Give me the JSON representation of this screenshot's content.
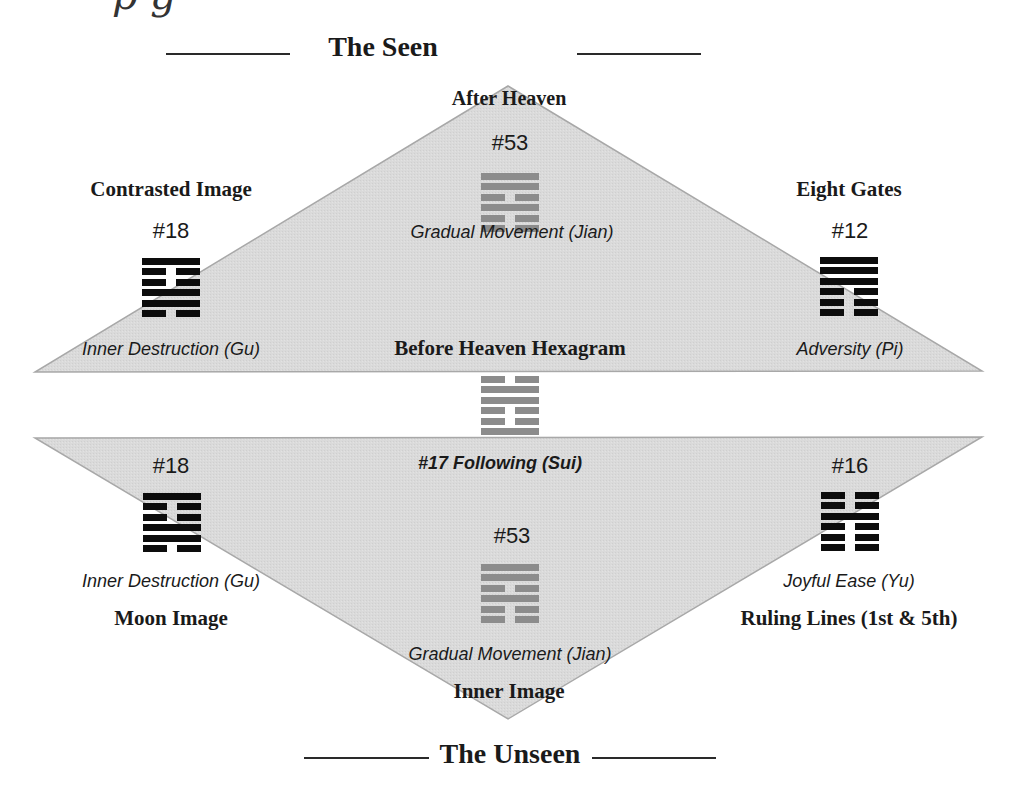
{
  "colors": {
    "triangle_fill": "#d9d9d9",
    "triangle_stroke": "#a8a8a8",
    "hex_black": "#0d0d0d",
    "hex_gray": "#8c8c8c",
    "text": "#1a1a1a"
  },
  "header": {
    "cut_off_text": "p          g"
  },
  "top_heading": "The Seen",
  "bottom_heading": "The Unseen",
  "upper": {
    "apex_label": "After Heaven",
    "center": {
      "number": "#53",
      "name": "Gradual Movement (Jian)",
      "lines": [
        "yang",
        "yang",
        "yin",
        "yang",
        "yin",
        "yin"
      ],
      "tone": "gray"
    },
    "left": {
      "title": "Contrasted Image",
      "number": "#18",
      "name": "Inner Destruction (Gu)",
      "lines": [
        "yang",
        "yin",
        "yin",
        "yang",
        "yang",
        "yin"
      ],
      "tone": "black"
    },
    "right": {
      "title": "Eight Gates",
      "number": "#12",
      "name": "Adversity (Pi)",
      "lines": [
        "yang",
        "yang",
        "yang",
        "yin",
        "yin",
        "yin"
      ],
      "tone": "black"
    },
    "base_label": "Before Heaven Hexagram"
  },
  "middle": {
    "hexagram": {
      "lines": [
        "yin",
        "yang",
        "yang",
        "yin",
        "yin",
        "yang"
      ],
      "tone": "gray"
    },
    "caption": "#17 Following (Sui)"
  },
  "lower": {
    "left": {
      "number": "#18",
      "name": "Inner Destruction (Gu)",
      "title": "Moon Image",
      "lines": [
        "yang",
        "yin",
        "yin",
        "yang",
        "yang",
        "yin"
      ],
      "tone": "black"
    },
    "right": {
      "number": "#16",
      "name": "Joyful Ease (Yu)",
      "title": "Ruling Lines (1st & 5th)",
      "lines": [
        "yin",
        "yin",
        "yang",
        "yin",
        "yin",
        "yin"
      ],
      "tone": "black"
    },
    "center": {
      "number": "#53",
      "name": "Gradual Movement (Jian)",
      "lines": [
        "yang",
        "yang",
        "yin",
        "yang",
        "yin",
        "yin"
      ],
      "tone": "gray"
    },
    "apex_label": "Inner Image"
  }
}
